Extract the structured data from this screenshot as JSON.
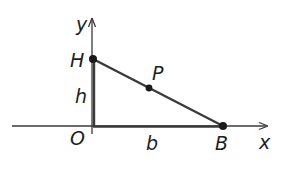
{
  "diagram": {
    "axes": {
      "x_label": "x",
      "y_label": "y"
    },
    "points": {
      "origin": "O",
      "top": "H",
      "right": "B",
      "midpoint": "P"
    },
    "segments": {
      "vertical_label": "h",
      "horizontal_label": "b"
    },
    "colors": {
      "line": "#3a3a3a",
      "text": "#1e1e1e",
      "background": "#ffffff"
    }
  }
}
